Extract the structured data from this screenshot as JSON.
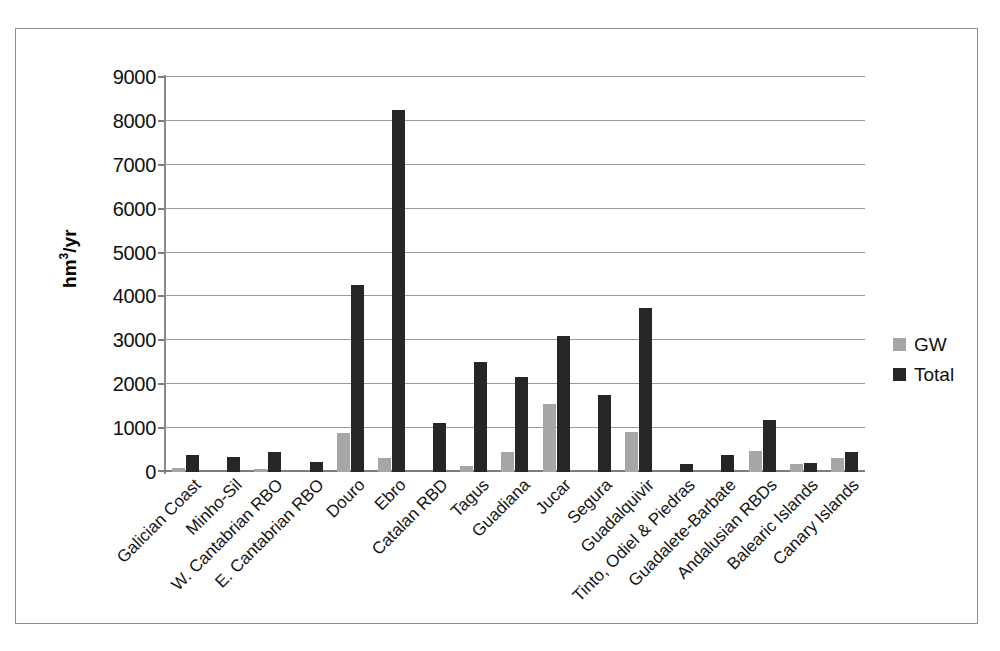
{
  "chart_data": {
    "type": "bar",
    "title": "",
    "subtitle": "",
    "xlabel": "",
    "ylabel": "hm3/yr",
    "ylabel_parts": {
      "pre": "hm",
      "sup": "3",
      "post": "/yr"
    },
    "ylim": [
      0,
      9000
    ],
    "ytick_step": 1000,
    "yticks": [
      "0",
      "1000",
      "2000",
      "3000",
      "4000",
      "5000",
      "6000",
      "7000",
      "8000",
      "9000"
    ],
    "grid": true,
    "legend_position": "right",
    "categories": [
      "Galician Coast",
      "Minho-Sil",
      "W. Cantabrian RBO",
      "E. Cantabrian RBO",
      "Douro",
      "Ebro",
      "Catalan RBD",
      "Tagus",
      "Guadiana",
      "Jucar",
      "Segura",
      "Guadalquivir",
      "Tinto, Odiel & Piedras",
      "Guadalete-Barbate",
      "Andalusian RBDs",
      "Balearic Islands",
      "Canary Islands"
    ],
    "series": [
      {
        "name": "GW",
        "color": "#a6a6a6",
        "values": [
          100,
          0,
          60,
          0,
          900,
          330,
          0,
          140,
          450,
          1550,
          0,
          920,
          0,
          0,
          490,
          190,
          310
        ]
      },
      {
        "name": "Total",
        "color": "#262626",
        "values": [
          390,
          340,
          450,
          230,
          4250,
          8250,
          1110,
          2510,
          2160,
          3110,
          1760,
          3730,
          180,
          390,
          1180,
          200,
          450
        ]
      }
    ]
  },
  "legend": {
    "items": [
      {
        "label": "GW",
        "color": "#a6a6a6"
      },
      {
        "label": "Total",
        "color": "#262626"
      }
    ]
  }
}
